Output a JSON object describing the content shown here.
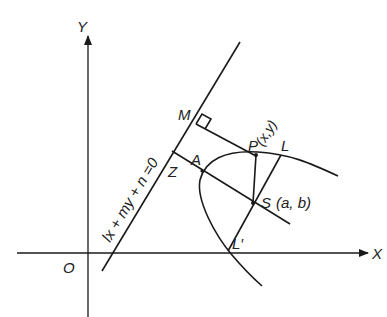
{
  "diagram": {
    "type": "parabola-focus-directrix",
    "axes": {
      "x_label": "X",
      "y_label": "Y",
      "origin_label": "O"
    },
    "directrix": {
      "equation_label": "lx + my + n =0"
    },
    "points": {
      "M": "M",
      "P": "P",
      "P_coords": "(x,y)",
      "L": "L",
      "Z": "Z",
      "A": "A",
      "S": "S",
      "S_coords": "(a, b)",
      "L_prime": "L′"
    },
    "colors": {
      "stroke": "#1a1a1a",
      "background": "#ffffff"
    }
  }
}
